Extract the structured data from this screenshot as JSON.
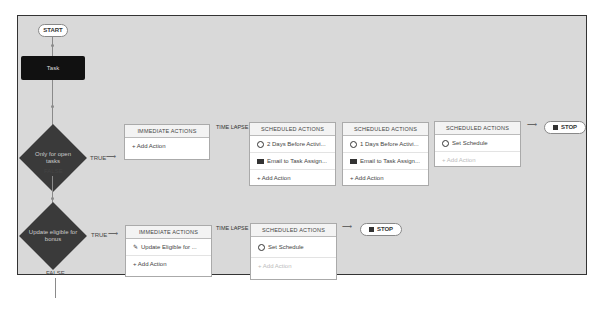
{
  "flow": {
    "start_label": "START",
    "task_label": "Task",
    "stop_label": "STOP",
    "criteria": [
      {
        "label": "Only for open tasks",
        "true_label": "TRUE",
        "false_label": "FALSE",
        "immediate": {
          "title": "IMMEDIATE ACTIONS",
          "rows": [
            {
              "icon": "plus-icon",
              "text": "+ Add Action"
            }
          ]
        },
        "time_lapse_label": "TIME LAPSE",
        "scheduled": [
          {
            "title": "SCHEDULED ACTIONS",
            "rows": [
              {
                "icon": "clock-icon",
                "text": "2 Days Before Activi..."
              },
              {
                "icon": "email-icon",
                "text": "Email to Task Assign..."
              },
              {
                "icon": "plus-icon",
                "text": "+ Add Action"
              }
            ]
          },
          {
            "title": "SCHEDULED ACTIONS",
            "rows": [
              {
                "icon": "clock-icon",
                "text": "1 Days Before Activi..."
              },
              {
                "icon": "email-icon",
                "text": "Email to Task Assign..."
              },
              {
                "icon": "plus-icon",
                "text": "+ Add Action"
              }
            ]
          },
          {
            "title": "SCHEDULED ACTIONS",
            "rows": [
              {
                "icon": "clock-icon",
                "text": "Set Schedule"
              },
              {
                "icon": "plus-icon",
                "text": "+ Add Action",
                "disabled": true
              }
            ]
          }
        ]
      },
      {
        "label": "Update eligible for bonus",
        "true_label": "TRUE",
        "false_label": "FALSE",
        "immediate": {
          "title": "IMMEDIATE ACTIONS",
          "rows": [
            {
              "icon": "pencil-icon",
              "text": "Update Eligible for ..."
            },
            {
              "icon": "plus-icon",
              "text": "+ Add Action"
            }
          ]
        },
        "time_lapse_label": "TIME LAPSE",
        "scheduled": [
          {
            "title": "SCHEDULED ACTIONS",
            "rows": [
              {
                "icon": "clock-icon",
                "text": "Set Schedule"
              },
              {
                "icon": "plus-icon",
                "text": "+ Add Action",
                "disabled": true
              }
            ]
          }
        ]
      }
    ]
  }
}
